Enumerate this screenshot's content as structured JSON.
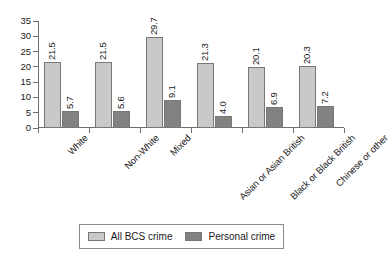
{
  "chart_data": {
    "type": "bar",
    "title": "",
    "subtitle": "",
    "xlabel": "",
    "ylabel": "",
    "ylim": [
      0,
      35
    ],
    "ytick_step": 5,
    "yticks": [
      "35",
      "30",
      "25",
      "20",
      "15",
      "10",
      "5",
      "0"
    ],
    "grid": false,
    "legend_position": "bottom",
    "categories": [
      "White",
      "Non-White",
      "Mixed",
      "Asian or Asian British",
      "Black or Black British",
      "Chinese or other"
    ],
    "series": [
      {
        "name": "All BCS crime",
        "color": "#c9c9c9",
        "values": [
          21.5,
          21.5,
          29.7,
          21.3,
          20.1,
          20.3
        ],
        "labels": [
          "21.5",
          "21.5",
          "29.7",
          "21.3",
          "20.1",
          "20.3"
        ]
      },
      {
        "name": "Personal crime",
        "color": "#828282",
        "values": [
          5.7,
          5.6,
          9.1,
          4.0,
          6.9,
          7.2
        ],
        "labels": [
          "5.7",
          "5.6",
          "9.1",
          "4.0",
          "6.9",
          "7.2"
        ]
      }
    ]
  },
  "legend": {
    "items": [
      {
        "label": "All BCS crime",
        "color": "#c9c9c9"
      },
      {
        "label": "Personal crime",
        "color": "#828282"
      }
    ]
  },
  "colors": {
    "background": "#ffffff",
    "axis": "#6e6e6e",
    "text": "#1a1a1a",
    "series_light": "#c9c9c9",
    "series_dark": "#828282",
    "bar_border": "#777777",
    "legend_border": "#8a8a8a"
  }
}
